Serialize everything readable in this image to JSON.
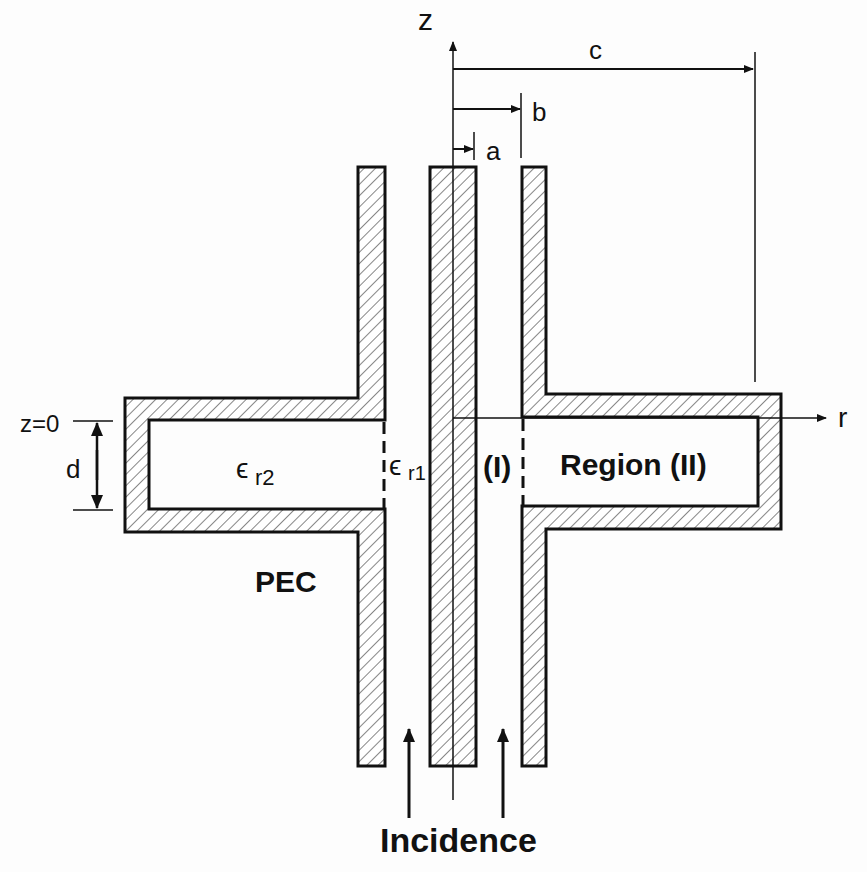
{
  "diagram": {
    "type": "coaxial-line-with-radial-cavity",
    "axes": {
      "z_label": "z",
      "r_label": "r",
      "z0_label": "z=0"
    },
    "dimensions": {
      "a": "a",
      "b": "b",
      "c": "c",
      "d": "d"
    },
    "regions": {
      "region1": "(I)",
      "region2": "Region (II)",
      "eps_r1_symbol": "ϵ",
      "eps_r1_sub": "r1",
      "eps_r2_symbol": "ϵ",
      "eps_r2_sub": "r2"
    },
    "material_label": "PEC",
    "incidence_label": "Incidence"
  }
}
